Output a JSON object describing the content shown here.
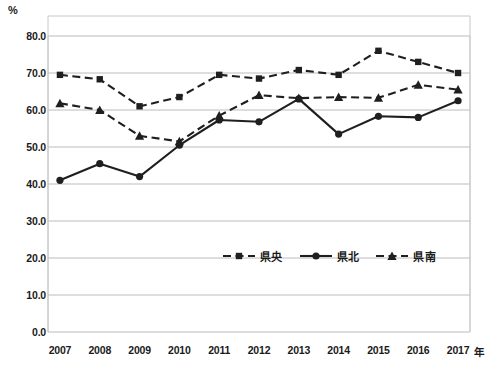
{
  "chart_data": {
    "type": "line",
    "title": "",
    "subtitle": "",
    "xlabel": "年",
    "ylabel": "%",
    "ylim": [
      0.0,
      80.0
    ],
    "xlim": [
      2007,
      2017
    ],
    "grid": true,
    "legend_position": "inside-bottom-center",
    "categories": [
      "2007",
      "2008",
      "2009",
      "2010",
      "2011",
      "2012",
      "2013",
      "2014",
      "2015",
      "2016",
      "2017"
    ],
    "yticks": [
      "0.0",
      "10.0",
      "20.0",
      "30.0",
      "40.0",
      "50.0",
      "60.0",
      "70.0",
      "80.0"
    ],
    "ytick_values": [
      0.0,
      10.0,
      20.0,
      30.0,
      40.0,
      50.0,
      60.0,
      70.0,
      80.0
    ],
    "series": [
      {
        "name": "県央",
        "marker": "square",
        "linestyle": "dashed",
        "color": "#1f1f1f",
        "values": [
          69.5,
          68.3,
          61.0,
          63.5,
          69.5,
          68.5,
          70.8,
          69.5,
          76.0,
          73.0,
          70.0
        ]
      },
      {
        "name": "県北",
        "marker": "circle",
        "linestyle": "solid",
        "color": "#1f1f1f",
        "values": [
          41.0,
          45.5,
          42.0,
          50.5,
          57.3,
          56.8,
          63.0,
          53.5,
          58.3,
          58.0,
          62.5
        ]
      },
      {
        "name": "県南",
        "marker": "triangle",
        "linestyle": "dashed",
        "color": "#1f1f1f",
        "values": [
          61.8,
          60.0,
          53.0,
          51.5,
          58.5,
          64.0,
          63.2,
          63.5,
          63.3,
          66.8,
          65.5
        ]
      }
    ]
  },
  "axis": {
    "unit_label": "%",
    "x_unit_label": "年"
  },
  "legend": {
    "items": [
      {
        "label": "県央"
      },
      {
        "label": "県北"
      },
      {
        "label": "県南"
      }
    ]
  }
}
